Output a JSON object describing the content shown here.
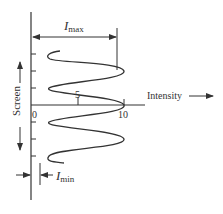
{
  "diagram": {
    "type": "intensity-pattern",
    "axis_x_label": "Intensity",
    "axis_y_label": "Screen",
    "ticks_x": [
      {
        "label": "0",
        "value": 0
      },
      {
        "label": "5",
        "value": 5
      },
      {
        "label": "10",
        "value": 10
      }
    ],
    "imax_label": "I",
    "imax_sub": "max",
    "imin_label": "I",
    "imin_sub": "min",
    "colors": {
      "ink": "#333333",
      "background": "#ffffff"
    }
  }
}
